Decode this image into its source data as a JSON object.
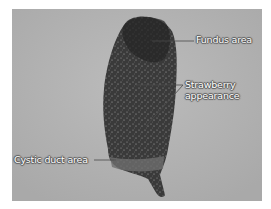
{
  "figure": {
    "colors": {
      "background": "#b3b3b3",
      "specimen_dark": "#2e2e2e",
      "label_text": "#ffffff",
      "leader_line": "#4a4a4a"
    },
    "annotations": [
      {
        "id": "fundus",
        "text": "Fundus area"
      },
      {
        "id": "strawberry",
        "lines": [
          "Strawberry",
          "appearance"
        ]
      },
      {
        "id": "cystic",
        "text": "Cystic duct area"
      }
    ]
  }
}
